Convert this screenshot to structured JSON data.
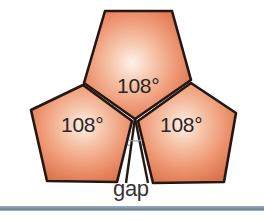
{
  "figure": {
    "background_color": "#ffffff",
    "shape_fill_light": "#fdeee7",
    "shape_fill_mid": "#ef9a77",
    "shape_fill_edge": "#d9714b",
    "shape_stroke": "#231612",
    "arc_color": "#8d8fa6",
    "label_color": "#2b2623",
    "rule_color": "#7d93a6"
  },
  "labels": {
    "angle_top": "108°",
    "angle_left": "108°",
    "angle_right": "108°",
    "gap": "gap"
  },
  "geometry": {
    "center_vertex": {
      "x": 135,
      "y": 118
    },
    "interior_angle_degrees": 108,
    "polygon_count": 3,
    "total_angle_degrees": 324,
    "gap_angle_degrees": 36,
    "pentagons": [
      {
        "name": "top-pentagon",
        "points": "135,118 85,82 105,11 172,11 190,80"
      },
      {
        "name": "left-pentagon",
        "points": "135,118 78,127 48,181 118,182 135,118"
      },
      {
        "name": "right-pentagon",
        "points": "135,118 192,129 224,182 152,183"
      }
    ],
    "left_pentagon_points": "133,121 85,84 32,110 47,181 118,182",
    "right_pentagon_points": "137,121 190,82 236,113 224,182 152,183",
    "gap_wedge_points": "135,118 127,184 147,184"
  }
}
